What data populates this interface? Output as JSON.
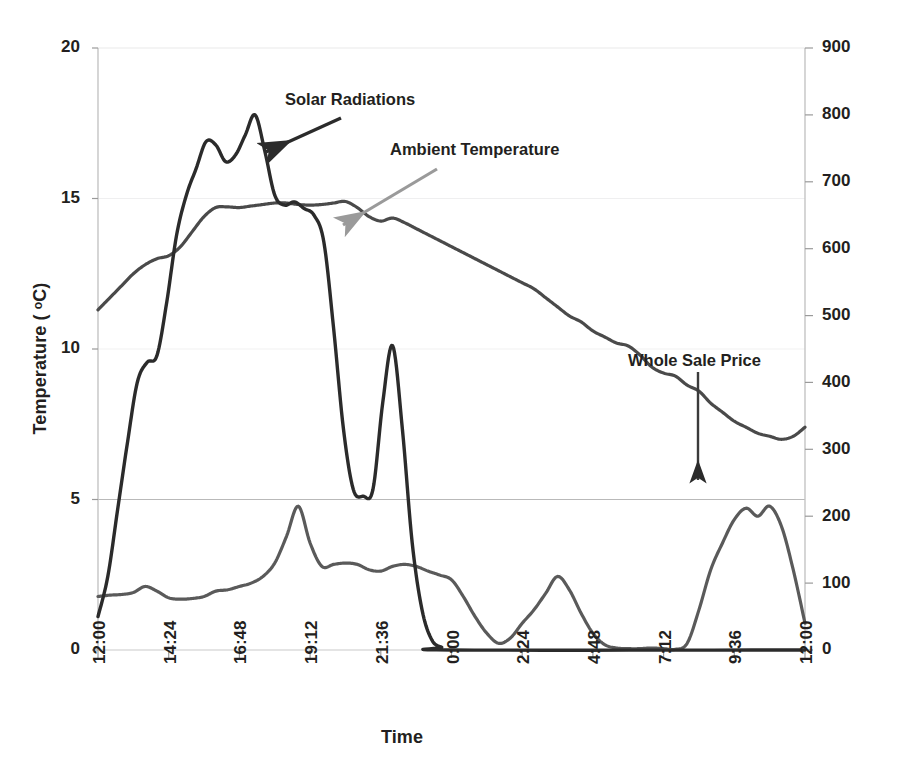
{
  "chart_data": {
    "type": "line",
    "title": "",
    "xlabel": "Time",
    "ylabel": "Temperature ( ᵒC)",
    "y2label": "Whole Sale Price ($ /MWh) / Solar Radiation (Watt/ m²)",
    "grid": true,
    "legend_position": "annotations",
    "xlim": [
      0,
      1440
    ],
    "ylim": [
      0,
      20
    ],
    "y2lim": [
      0,
      900
    ],
    "xtick_labels": [
      "12:00",
      "14:24",
      "16:48",
      "19:12",
      "21:36",
      "0:00",
      "2:24",
      "4:48",
      "7:12",
      "9:36",
      "12:00"
    ],
    "xtick_minutes": [
      0,
      144,
      288,
      432,
      576,
      720,
      864,
      1008,
      1152,
      1296,
      1440
    ],
    "ytick_labels": [
      "0",
      "5",
      "10",
      "15",
      "20"
    ],
    "ytick_values": [
      0,
      5,
      10,
      15,
      20
    ],
    "y2tick_labels": [
      "0",
      "100",
      "200",
      "300",
      "400",
      "500",
      "600",
      "700",
      "800",
      "900"
    ],
    "y2tick_values": [
      0,
      100,
      200,
      300,
      400,
      500,
      600,
      700,
      800,
      900
    ],
    "series": [
      {
        "name": "Ambient Temperature",
        "axis": "left",
        "unit": "ᵒC",
        "color": "#4a4a4a",
        "x": [
          0,
          24,
          48,
          72,
          96,
          120,
          144,
          168,
          192,
          216,
          240,
          264,
          288,
          312,
          336,
          360,
          384,
          408,
          432,
          456,
          480,
          504,
          528,
          552,
          576,
          600,
          624,
          648,
          672,
          696,
          720,
          744,
          768,
          792,
          816,
          840,
          864,
          888,
          912,
          936,
          960,
          984,
          1008,
          1032,
          1056,
          1080,
          1104,
          1128,
          1152,
          1176,
          1200,
          1224,
          1248,
          1272,
          1296,
          1320,
          1344,
          1368,
          1392,
          1416,
          1440
        ],
        "values": [
          11.3,
          11.7,
          12.1,
          12.5,
          12.8,
          13.0,
          13.1,
          13.4,
          13.9,
          14.4,
          14.7,
          14.72,
          14.7,
          14.75,
          14.8,
          14.85,
          14.85,
          14.8,
          14.78,
          14.8,
          14.85,
          14.9,
          14.7,
          14.4,
          14.25,
          14.35,
          14.2,
          14.0,
          13.8,
          13.6,
          13.4,
          13.2,
          13.0,
          12.8,
          12.6,
          12.4,
          12.2,
          12.0,
          11.7,
          11.4,
          11.1,
          10.9,
          10.6,
          10.4,
          10.2,
          10.1,
          9.8,
          9.4,
          9.2,
          9.1,
          8.8,
          8.6,
          8.2,
          7.9,
          7.6,
          7.4,
          7.2,
          7.1,
          7.0,
          7.1,
          7.4
        ]
      },
      {
        "name": "Solar Radiations",
        "axis": "right",
        "unit": "Watt/ m²",
        "color": "#2b2b2b",
        "x": [
          0,
          20,
          40,
          60,
          80,
          100,
          120,
          140,
          160,
          180,
          200,
          220,
          240,
          260,
          280,
          300,
          320,
          340,
          360,
          380,
          400,
          420,
          440,
          460,
          480,
          500,
          520,
          540,
          560,
          580,
          600,
          620,
          640,
          660,
          680,
          700,
          720,
          1440
        ],
        "values": [
          50,
          110,
          210,
          310,
          400,
          430,
          440,
          520,
          620,
          680,
          720,
          760,
          755,
          730,
          740,
          770,
          800,
          745,
          680,
          665,
          670,
          660,
          650,
          610,
          480,
          330,
          240,
          230,
          240,
          370,
          455,
          330,
          160,
          60,
          15,
          4,
          0,
          0
        ]
      },
      {
        "name": "Whole Sale Price",
        "axis": "right",
        "unit": "$ /MWh",
        "color": "#5a5a5a",
        "x": [
          0,
          24,
          48,
          72,
          96,
          120,
          144,
          168,
          192,
          216,
          240,
          264,
          288,
          312,
          336,
          360,
          384,
          408,
          432,
          456,
          480,
          504,
          528,
          552,
          576,
          600,
          624,
          648,
          672,
          696,
          720,
          744,
          768,
          792,
          816,
          840,
          864,
          888,
          912,
          936,
          960,
          984,
          1008,
          1032,
          1056,
          1080,
          1104,
          1128,
          1152,
          1176,
          1200,
          1224,
          1248,
          1272,
          1296,
          1320,
          1344,
          1368,
          1392,
          1416,
          1440
        ],
        "values": [
          80,
          82,
          83,
          86,
          95,
          88,
          78,
          76,
          77,
          80,
          88,
          90,
          95,
          100,
          110,
          130,
          170,
          215,
          160,
          125,
          128,
          130,
          128,
          120,
          118,
          125,
          128,
          125,
          118,
          112,
          105,
          80,
          50,
          25,
          10,
          18,
          40,
          60,
          85,
          110,
          90,
          55,
          25,
          8,
          3,
          2,
          2,
          3,
          2,
          1,
          10,
          60,
          120,
          160,
          195,
          212,
          200,
          215,
          185,
          120,
          40
        ]
      }
    ],
    "annotations": [
      {
        "text": "Solar Radiations",
        "color": "#2b2b2b"
      },
      {
        "text": "Ambient Temperature",
        "color": "#231f20"
      },
      {
        "text": "Whole Sale Price",
        "color": "#231f20"
      }
    ]
  },
  "axes": {
    "left_title": "Temperature ( ᵒC)",
    "right_title": "Whole Sale Price ($ /MWh) / Solar Radiation (Watt/ m²)",
    "x_title": "Time",
    "left_ticks": [
      "0",
      "5",
      "10",
      "15",
      "20"
    ],
    "right_ticks": [
      "0",
      "100",
      "200",
      "300",
      "400",
      "500",
      "600",
      "700",
      "800",
      "900"
    ],
    "x_ticks": [
      "12:00",
      "14:24",
      "16:48",
      "19:12",
      "21:36",
      "0:00",
      "2:24",
      "4:48",
      "7:12",
      "9:36",
      "12:00"
    ]
  },
  "annotations": {
    "solar": "Solar Radiations",
    "ambient": "Ambient Temperature",
    "price": "Whole Sale Price"
  },
  "colors": {
    "solar_line": "#2b2b2b",
    "temperature_line": "#4a4a4a",
    "price_line": "#5a5a5a",
    "grid": "#e6e6e6",
    "axis": "#bfbfbf",
    "text": "#231f20",
    "arrow_dark": "#2b2b2b",
    "arrow_gray": "#9a9a9a"
  }
}
